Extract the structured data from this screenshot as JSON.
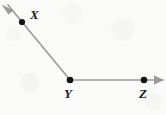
{
  "figure": {
    "kind": "geometry-angle-diagram",
    "width": 166,
    "height": 115,
    "background_color": "#fafaf9",
    "stroke_color": "#9a9a9a",
    "point_color": "#141414",
    "label_color": "#1a1a1a",
    "points": [
      {
        "id": "X",
        "label": "X",
        "x": 22,
        "y": 22,
        "label_x": 30,
        "label_y": 8
      },
      {
        "id": "Y",
        "label": "Y",
        "x": 70,
        "y": 80,
        "label_x": 64,
        "label_y": 87
      },
      {
        "id": "Z",
        "label": "Z",
        "x": 144,
        "y": 80,
        "label_x": 139,
        "label_y": 87
      }
    ],
    "rays": [
      {
        "id": "ray-YX",
        "from": "Y",
        "through": "X",
        "arrow_at": "far-end",
        "start_x": 70,
        "start_y": 80,
        "end_x": 7,
        "end_y": 4
      },
      {
        "id": "ray-YZ",
        "from": "Y",
        "through": "Z",
        "arrow_at": "far-end",
        "start_x": 70,
        "start_y": 80,
        "end_x": 158,
        "end_y": 80
      }
    ],
    "arrowheads": [
      {
        "id": "arrowhead-upper-left",
        "tip_x": 2,
        "tip_y": 5,
        "direction": "up-left"
      },
      {
        "id": "arrowhead-right",
        "tip_x": 164,
        "tip_y": 80,
        "direction": "right"
      }
    ]
  }
}
